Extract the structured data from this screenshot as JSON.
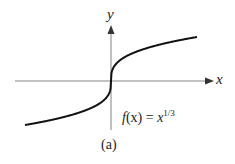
{
  "figure": {
    "caption": "(a)",
    "x_axis_label": "x",
    "y_axis_label": "y",
    "function_label": {
      "name": "f",
      "arg": "(x)",
      "eq": " = ",
      "base": "x",
      "exponent": "1/3"
    }
  },
  "chart_data": {
    "type": "line",
    "title": "",
    "xlabel": "x",
    "ylabel": "y",
    "annotation": "f(x) = x^{1/3}",
    "caption": "(a)",
    "grid": false,
    "legend": "none",
    "series": [
      {
        "name": "f(x) = x^(1/3)",
        "x": [
          -8,
          -6,
          -4,
          -2,
          -1,
          -0.5,
          -0.1,
          0,
          0.1,
          0.5,
          1,
          2,
          4,
          6,
          8
        ],
        "values": [
          -2,
          -1.817,
          -1.587,
          -1.26,
          -1,
          -0.794,
          -0.464,
          0,
          0.464,
          0.794,
          1,
          1.26,
          1.587,
          1.817,
          2
        ]
      }
    ],
    "colors": {
      "curve": "#111111",
      "axes": "#555555"
    }
  }
}
